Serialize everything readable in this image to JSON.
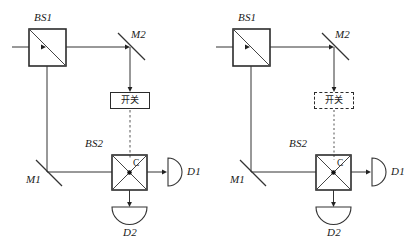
{
  "figure": {
    "type": "optics-schematic",
    "stroke_color": "#333333",
    "text_color": "#1a1a1a",
    "background": "#ffffff"
  },
  "panels": [
    {
      "id": "left",
      "switch_border_style": "solid",
      "components": {
        "bs1_label": "BS1",
        "bs2_label": "BS2",
        "m1_label": "M1",
        "m2_label": "M2",
        "c_label": "C",
        "d1_label": "D1",
        "d2_label": "D2",
        "switch_label": "开关"
      }
    },
    {
      "id": "right",
      "switch_border_style": "dashed",
      "components": {
        "bs1_label": "BS1",
        "bs2_label": "BS2",
        "m1_label": "M1",
        "m2_label": "M2",
        "c_label": "C",
        "d1_label": "D1",
        "d2_label": "D2",
        "switch_label": "开关"
      }
    }
  ]
}
